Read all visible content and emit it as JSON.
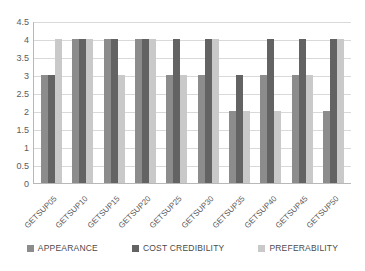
{
  "chart_data": {
    "type": "bar",
    "title": "",
    "subtitle": "",
    "xlabel": "",
    "ylabel": "",
    "ylim": [
      0,
      4.5
    ],
    "yticks": [
      "0",
      "0.5",
      "1",
      "1.5",
      "2",
      "2.5",
      "3",
      "3.5",
      "4",
      "4.5"
    ],
    "ytick_values": [
      0,
      0.5,
      1,
      1.5,
      2,
      2.5,
      3,
      3.5,
      4,
      4.5
    ],
    "grid": true,
    "legend_position": "bottom",
    "categories": [
      "GETSUP05",
      "GETSUP10",
      "GETSUP15",
      "GETSUP20",
      "GETSUP25",
      "GETSUP30",
      "GETSUP35",
      "GETSUP40",
      "GETSUP45",
      "GETSUP50"
    ],
    "series": [
      {
        "name": "APPEARANCE",
        "color": "#8c8c8c",
        "values": [
          3,
          4,
          4,
          4,
          3,
          3,
          2,
          3,
          3,
          2
        ]
      },
      {
        "name": "COST CREDIBILITY",
        "color": "#636363",
        "values": [
          3,
          4,
          4,
          4,
          4,
          4,
          3,
          4,
          4,
          4
        ]
      },
      {
        "name": "PREFERABILITY",
        "color": "#c9c9c9",
        "values": [
          4,
          4,
          3,
          4,
          3,
          4,
          2,
          2,
          3,
          4
        ]
      }
    ]
  },
  "legend": {
    "items": [
      {
        "label": "APPEARANCE"
      },
      {
        "label": "COST CREDIBILITY"
      },
      {
        "label": "PREFERABILITY"
      }
    ]
  }
}
